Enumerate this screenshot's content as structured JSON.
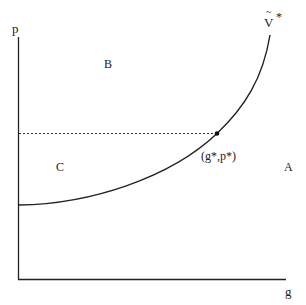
{
  "diagram": {
    "axes": {
      "y_label": "p",
      "x_label": "g"
    },
    "curve": {
      "label_base": "V",
      "label_accent": "~",
      "label_superscript": "*"
    },
    "point": {
      "label": "(g*,p*)"
    },
    "regions": {
      "top_left": "B",
      "left_middle": "C",
      "right": "A"
    },
    "colors": {
      "ink": "#222222",
      "background": "#ffffff"
    }
  }
}
